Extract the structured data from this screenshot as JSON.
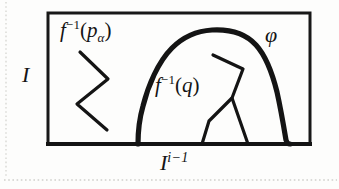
{
  "figure": {
    "type": "mathematical-diagram",
    "background_color": "#fdfdfc",
    "ink_color": "#141414",
    "labels": {
      "f_inverse_p_alpha": {
        "base": "f",
        "superscript": "−1",
        "argument_open": "(",
        "argument_base": "p",
        "argument_subscript": "α",
        "argument_close": ")"
      },
      "f_inverse_q": {
        "base": "f",
        "superscript": "−1",
        "argument_open": "(",
        "argument_base": "q",
        "argument_close": ")"
      },
      "phi": "φ",
      "interval_I": "I",
      "cube_I": {
        "base": "I",
        "superscript": "i−1"
      }
    },
    "geometry": {
      "rect": {
        "x": 48,
        "y": 13,
        "width": 262,
        "height": 131,
        "stroke_width": 3
      },
      "bump_stroke_width": 5,
      "zigzag_stroke_width": 3
    }
  }
}
